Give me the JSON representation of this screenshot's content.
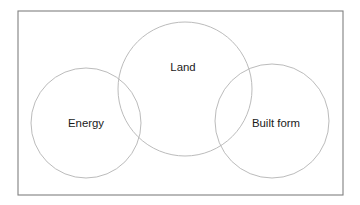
{
  "diagram": {
    "type": "venn-three-circle-chain",
    "background_color": "#ffffff",
    "frame": {
      "name": "outer-border",
      "stroke_color": "#808080",
      "x": 18,
      "y": 11,
      "width": 325,
      "height": 184
    },
    "circle_stroke_color": "#b3b3b3",
    "label_color": "#1a1a1a",
    "circles": [
      {
        "id": "energy",
        "label": "Energy",
        "cx": 86,
        "cy": 123,
        "r": 55,
        "label_x": 86,
        "label_y": 124
      },
      {
        "id": "land",
        "label": "Land",
        "cx": 185,
        "cy": 89,
        "r": 67,
        "label_x": 183,
        "label_y": 68
      },
      {
        "id": "built-form",
        "label": "Built form",
        "cx": 272,
        "cy": 121,
        "r": 57,
        "label_x": 276,
        "label_y": 124
      }
    ]
  }
}
